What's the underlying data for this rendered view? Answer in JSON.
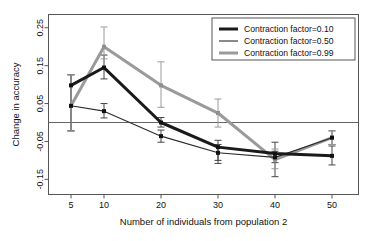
{
  "chart_data": {
    "type": "line",
    "title": "",
    "xlabel": "Number of individuals from population 2",
    "ylabel": "Change in accuracy",
    "x": [
      5,
      10,
      20,
      30,
      40,
      50
    ],
    "xticklabels": [
      "5",
      "10",
      "20",
      "30",
      "40",
      "50"
    ],
    "yticks": [
      -0.15,
      -0.05,
      0.05,
      0.15,
      0.25
    ],
    "yticklabels": [
      "-0.15",
      "-0.05",
      "0.05",
      "0.15",
      "0.25"
    ],
    "ylim": [
      -0.19,
      0.285
    ],
    "grid": false,
    "reference_line_y": 0,
    "legend_position": "top-right",
    "series": [
      {
        "name": "Contraction factor=0.10",
        "color": "#1a1a1a",
        "width": 3.0,
        "values": [
          0.098,
          0.145,
          0.0,
          -0.065,
          -0.082,
          -0.088
        ],
        "err_low": [
          -0.022,
          0.115,
          -0.012,
          -0.108,
          -0.143,
          -0.112
        ],
        "err_high": [
          0.126,
          0.178,
          0.013,
          -0.047,
          -0.052,
          -0.062
        ]
      },
      {
        "name": "Contraction factor=0.50",
        "color": "#2b2b2b",
        "width": 1.1,
        "values": [
          0.044,
          0.03,
          -0.036,
          -0.08,
          -0.092,
          -0.04
        ],
        "err_low": [
          -0.022,
          0.012,
          -0.052,
          -0.1,
          -0.106,
          -0.058
        ],
        "err_high": [
          0.126,
          0.05,
          -0.02,
          -0.058,
          -0.076,
          -0.022
        ]
      },
      {
        "name": "Contraction factor=0.99",
        "color": "#9a9a9a",
        "width": 3.0,
        "values": [
          0.044,
          0.2,
          0.098,
          0.025,
          -0.098,
          -0.04
        ],
        "err_low": [
          -0.022,
          0.168,
          0.04,
          -0.012,
          -0.122,
          -0.058
        ],
        "err_high": [
          0.126,
          0.252,
          0.16,
          0.062,
          -0.07,
          -0.022
        ]
      }
    ]
  },
  "legend": {
    "items": [
      {
        "label": "Contraction factor=0.10"
      },
      {
        "label": "Contraction factor=0.50"
      },
      {
        "label": "Contraction factor=0.99"
      }
    ]
  }
}
